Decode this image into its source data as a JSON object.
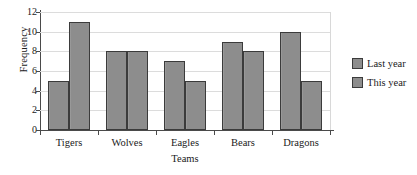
{
  "chart_data": {
    "type": "bar",
    "title": "",
    "xlabel": "Teams",
    "ylabel": "Frequency",
    "categories": [
      "Tigers",
      "Wolves",
      "Eagles",
      "Bears",
      "Dragons"
    ],
    "series": [
      {
        "name": "Last year",
        "values": [
          5,
          8,
          7,
          9,
          10
        ],
        "color": "#8d8d8d"
      },
      {
        "name": "This year",
        "values": [
          11,
          8,
          5,
          8,
          5
        ],
        "color": "#8d8d8d"
      }
    ],
    "ylim": [
      0,
      12
    ],
    "yticks": [
      0,
      2,
      4,
      6,
      8,
      10,
      12
    ],
    "grid": true,
    "legend_position": "right",
    "bar_edge_color": "#3b3b3b"
  },
  "axes": {
    "y_title": "Frequency",
    "x_title": "Teams"
  },
  "legend": {
    "entries": [
      {
        "label": "Last year"
      },
      {
        "label": "This year"
      }
    ]
  }
}
